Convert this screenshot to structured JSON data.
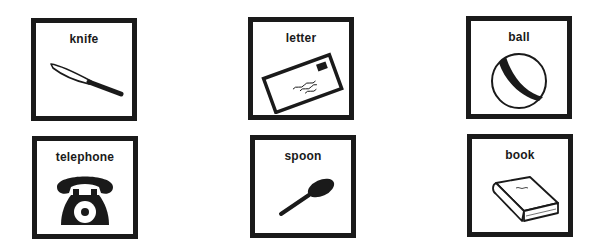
{
  "cards": [
    {
      "label": "knife",
      "icon": "knife-icon"
    },
    {
      "label": "letter",
      "icon": "letter-icon"
    },
    {
      "label": "ball",
      "icon": "ball-icon"
    },
    {
      "label": "telephone",
      "icon": "telephone-icon"
    },
    {
      "label": "spoon",
      "icon": "spoon-icon"
    },
    {
      "label": "book",
      "icon": "book-icon"
    }
  ],
  "colors": {
    "ink": "#1a1a1a",
    "background": "#ffffff"
  }
}
